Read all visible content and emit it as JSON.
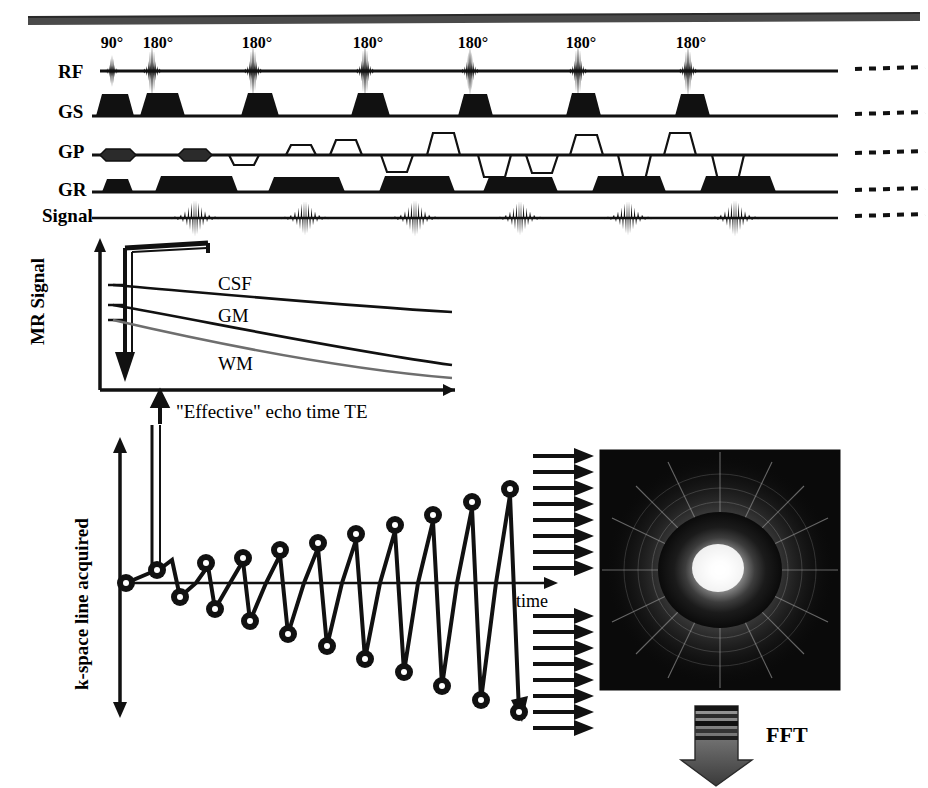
{
  "figure": {
    "type": "mri-pulse-sequence-diagram",
    "top_rule": true
  },
  "sequence": {
    "channel_labels": [
      "RF",
      "GS",
      "GP",
      "GR",
      "Signal"
    ],
    "rf_pulse_labels": [
      "90°",
      "180°",
      "180°",
      "180°",
      "180°",
      "180°",
      "180°"
    ],
    "rf_pulse_x": [
      112,
      152,
      253,
      365,
      470,
      578,
      688
    ],
    "rf_label_x": [
      112,
      156,
      257,
      368,
      473,
      581,
      691
    ],
    "gs_lobe_x": [
      112,
      152,
      253,
      365,
      470,
      578,
      688
    ],
    "gp_blip_x": [
      112,
      190
    ],
    "gp_trapezoid_x": [
      212,
      265,
      300,
      345,
      398,
      440,
      492,
      530,
      580,
      628,
      668,
      720
    ],
    "gp_trapezoid_dir": [
      "down",
      "up",
      "up",
      "down",
      "up",
      "down",
      "down",
      "up",
      "down",
      "up",
      "down",
      "up"
    ],
    "gr_prephase_x": 112,
    "gr_readout_x": [
      195,
      305,
      415,
      520,
      628,
      735
    ],
    "echo_x": [
      195,
      305,
      415,
      520,
      628,
      735
    ],
    "continuation_marker": "dotted",
    "continuation_x": 845
  },
  "decay_plot": {
    "y_axis_label": "MR Signal",
    "x_axis_label": "\"Effective\" echo time TE",
    "curves": [
      {
        "name": "CSF",
        "color": "#000000",
        "start_value": 0.74,
        "end_value": 0.6,
        "label_x": 218,
        "label_y": 290
      },
      {
        "name": "GM",
        "color": "#000000",
        "start_value": 0.6,
        "end_value": 0.33,
        "label_x": 218,
        "label_y": 322
      },
      {
        "name": "WM",
        "color": "#6e6e6e",
        "start_value": 0.53,
        "end_value": 0.24,
        "label_x": 218,
        "label_y": 362
      }
    ],
    "te_marker_note": "bracket pointing to effective TE",
    "axis_origin_x": 100,
    "axis_origin_y": 390,
    "axis_top_y": 240,
    "axis_right_x": 455
  },
  "kspace_plot": {
    "y_axis_label": "k-space line acquired",
    "x_axis_label": "time",
    "ordering": "centric (low-to-high), alternating polarity",
    "points_count": 23,
    "k_values": [
      0,
      1,
      -1,
      2,
      -2,
      3,
      -3,
      4,
      -4,
      5,
      -5,
      6,
      -6,
      7,
      -7,
      8,
      -8,
      9,
      -9,
      10,
      -10,
      11,
      -11
    ],
    "arrows_above_count": 8,
    "arrows_below_count": 8,
    "axis_origin_x": 120,
    "axis_zero_y": 583,
    "axis_top_y": 440,
    "axis_bottom_y": 712,
    "axis_right_x": 560
  },
  "kspace_image": {
    "description": "k-space magnitude image, bright center with radial interference pattern",
    "x": 600,
    "y": 450,
    "width": 240,
    "height": 240,
    "background": "#0a0a0a",
    "center_color": "#ffffff"
  },
  "fft": {
    "label": "FFT",
    "arrow_direction": "down",
    "stripe_count": 5
  }
}
